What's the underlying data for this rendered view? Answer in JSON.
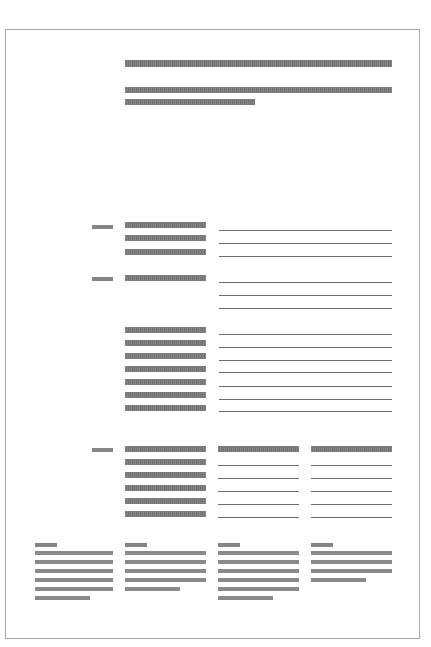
{
  "document": {
    "type": "greeked-wireframe-document",
    "page_border_color": "#a8a8a8",
    "bar_color": "#7b7b7b",
    "rule_color": "#6e6e6e"
  },
  "header": {
    "title_bar": {
      "x": 125,
      "y": 60,
      "w": 267,
      "h": 7
    },
    "subtitle_bars": [
      {
        "x": 125,
        "y": 87,
        "w": 267,
        "h": 6
      },
      {
        "x": 125,
        "y": 99,
        "w": 130,
        "h": 6
      }
    ]
  },
  "sections": [
    {
      "name": "section-1",
      "label_bar": {
        "x": 92,
        "y": 225,
        "w": 21,
        "h": 4
      },
      "field_bars": [
        {
          "x": 125,
          "y": 222,
          "w": 81,
          "h": 6
        },
        {
          "x": 125,
          "y": 235,
          "w": 81,
          "h": 6
        },
        {
          "x": 125,
          "y": 249,
          "w": 81,
          "h": 6
        }
      ],
      "input_lines": [
        {
          "x": 219,
          "y": 230,
          "w": 173
        },
        {
          "x": 219,
          "y": 243,
          "w": 173
        },
        {
          "x": 219,
          "y": 256,
          "w": 173
        }
      ]
    },
    {
      "name": "section-2",
      "label_bar": {
        "x": 92,
        "y": 277,
        "w": 21,
        "h": 4
      },
      "field_bars": [
        {
          "x": 125,
          "y": 275,
          "w": 81,
          "h": 6
        }
      ],
      "input_lines": [
        {
          "x": 219,
          "y": 282,
          "w": 173
        },
        {
          "x": 219,
          "y": 295,
          "w": 173
        },
        {
          "x": 219,
          "y": 308,
          "w": 173
        }
      ]
    },
    {
      "name": "section-3",
      "label_bar": null,
      "field_bars": [
        {
          "x": 125,
          "y": 327,
          "w": 81,
          "h": 6
        },
        {
          "x": 125,
          "y": 340,
          "w": 81,
          "h": 6
        },
        {
          "x": 125,
          "y": 353,
          "w": 81,
          "h": 6
        },
        {
          "x": 125,
          "y": 366,
          "w": 81,
          "h": 6
        },
        {
          "x": 125,
          "y": 379,
          "w": 81,
          "h": 6
        },
        {
          "x": 125,
          "y": 392,
          "w": 81,
          "h": 6
        },
        {
          "x": 125,
          "y": 405,
          "w": 81,
          "h": 6
        }
      ],
      "input_lines": [
        {
          "x": 219,
          "y": 334,
          "w": 173
        },
        {
          "x": 219,
          "y": 347,
          "w": 173
        },
        {
          "x": 219,
          "y": 360,
          "w": 173
        },
        {
          "x": 219,
          "y": 372,
          "w": 173
        },
        {
          "x": 219,
          "y": 386,
          "w": 173
        },
        {
          "x": 219,
          "y": 399,
          "w": 173
        },
        {
          "x": 219,
          "y": 411,
          "w": 173
        }
      ]
    },
    {
      "name": "section-4-table",
      "label_bar": {
        "x": 92,
        "y": 448,
        "w": 21,
        "h": 4
      },
      "field_bars": [
        {
          "x": 125,
          "y": 446,
          "w": 81,
          "h": 6
        },
        {
          "x": 218,
          "y": 446,
          "w": 81,
          "h": 6
        },
        {
          "x": 311,
          "y": 446,
          "w": 81,
          "h": 6
        },
        {
          "x": 125,
          "y": 459,
          "w": 81,
          "h": 6
        },
        {
          "x": 125,
          "y": 472,
          "w": 81,
          "h": 6
        },
        {
          "x": 125,
          "y": 485,
          "w": 81,
          "h": 6
        },
        {
          "x": 125,
          "y": 498,
          "w": 81,
          "h": 6
        },
        {
          "x": 125,
          "y": 511,
          "w": 81,
          "h": 6
        }
      ],
      "input_lines": [
        {
          "x": 218,
          "y": 465,
          "w": 81
        },
        {
          "x": 218,
          "y": 478,
          "w": 81
        },
        {
          "x": 218,
          "y": 491,
          "w": 81
        },
        {
          "x": 218,
          "y": 504,
          "w": 81
        },
        {
          "x": 218,
          "y": 517,
          "w": 81
        },
        {
          "x": 311,
          "y": 465,
          "w": 81
        },
        {
          "x": 311,
          "y": 478,
          "w": 81
        },
        {
          "x": 311,
          "y": 491,
          "w": 81
        },
        {
          "x": 311,
          "y": 504,
          "w": 81
        },
        {
          "x": 311,
          "y": 517,
          "w": 81
        }
      ]
    }
  ],
  "footer_columns": [
    {
      "heading_bar": {
        "x": 35,
        "y": 543,
        "w": 22,
        "h": 4
      },
      "text_bars": [
        {
          "x": 35,
          "y": 551,
          "w": 78,
          "h": 4
        },
        {
          "x": 35,
          "y": 560,
          "w": 78,
          "h": 4
        },
        {
          "x": 35,
          "y": 569,
          "w": 78,
          "h": 4
        },
        {
          "x": 35,
          "y": 578,
          "w": 78,
          "h": 4
        },
        {
          "x": 35,
          "y": 587,
          "w": 78,
          "h": 4
        },
        {
          "x": 35,
          "y": 596,
          "w": 55,
          "h": 4
        }
      ]
    },
    {
      "heading_bar": {
        "x": 125,
        "y": 543,
        "w": 22,
        "h": 4
      },
      "text_bars": [
        {
          "x": 125,
          "y": 551,
          "w": 81,
          "h": 4
        },
        {
          "x": 125,
          "y": 560,
          "w": 81,
          "h": 4
        },
        {
          "x": 125,
          "y": 569,
          "w": 81,
          "h": 4
        },
        {
          "x": 125,
          "y": 578,
          "w": 81,
          "h": 4
        },
        {
          "x": 125,
          "y": 587,
          "w": 55,
          "h": 4
        }
      ]
    },
    {
      "heading_bar": {
        "x": 218,
        "y": 543,
        "w": 22,
        "h": 4
      },
      "text_bars": [
        {
          "x": 218,
          "y": 551,
          "w": 81,
          "h": 4
        },
        {
          "x": 218,
          "y": 560,
          "w": 81,
          "h": 4
        },
        {
          "x": 218,
          "y": 569,
          "w": 81,
          "h": 4
        },
        {
          "x": 218,
          "y": 578,
          "w": 81,
          "h": 4
        },
        {
          "x": 218,
          "y": 587,
          "w": 81,
          "h": 4
        },
        {
          "x": 218,
          "y": 596,
          "w": 55,
          "h": 4
        }
      ]
    },
    {
      "heading_bar": {
        "x": 311,
        "y": 543,
        "w": 22,
        "h": 4
      },
      "text_bars": [
        {
          "x": 311,
          "y": 551,
          "w": 81,
          "h": 4
        },
        {
          "x": 311,
          "y": 560,
          "w": 81,
          "h": 4
        },
        {
          "x": 311,
          "y": 569,
          "w": 81,
          "h": 4
        },
        {
          "x": 311,
          "y": 578,
          "w": 55,
          "h": 4
        }
      ]
    }
  ]
}
